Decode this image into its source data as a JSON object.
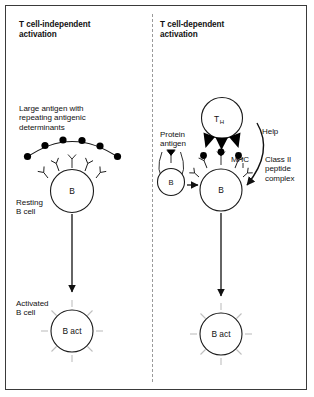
{
  "figure": {
    "name": "b-cell-activation-diagram",
    "panels": {
      "left": {
        "title": "T cell-independent\nactivation",
        "antigen_caption": "Large antigen with\nrepeating antigenic\ndeterminants",
        "resting_label": "Resting\nB cell",
        "activated_label": "Activated\nB cell",
        "b_cell_label": "B",
        "b_act_label": "B act",
        "determinant_count": 6,
        "receptor_count": 5
      },
      "right": {
        "title": "T cell-dependent\nactivation",
        "protein_antigen_label": "Protein\nantigen",
        "help_label": "Help",
        "mhc_label": "MHC",
        "class_ii_label": "Class II\npeptide\ncomplex",
        "th_cell_label": "T",
        "th_cell_sub": "H",
        "small_b_label": "B",
        "b_cell_label": "B",
        "b_act_label": "B act",
        "tcr_count": 3,
        "mhc_complex_count": 3
      }
    },
    "colors": {
      "border": "#3a3a3a",
      "divider": "#9a9a9a",
      "ink": "#1a1a1a",
      "dot": "#000000",
      "ray": "#bfbfbf",
      "background": "#ffffff"
    }
  }
}
